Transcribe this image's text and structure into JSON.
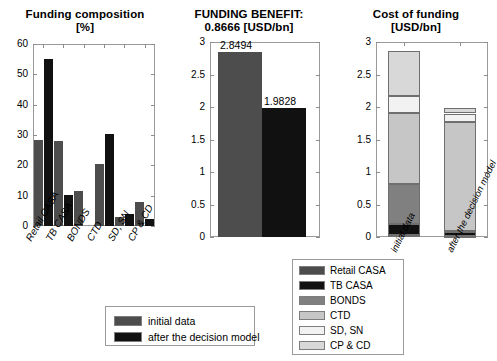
{
  "colors": {
    "retail_casa": "#4d4d4d",
    "tb_casa": "#111111",
    "bonds": "#808080",
    "ctd": "#c6c6c6",
    "sd_sn": "#f2f2f2",
    "cp_cd": "#d8d8d8",
    "initial": "#4d4d4d",
    "after": "#111111",
    "axis": "#9a9a9a"
  },
  "chart_data": [
    {
      "type": "bar",
      "title": "Funding composition",
      "subtitle": "[%]",
      "xlabel": "",
      "ylabel": "",
      "ylim": [
        0,
        60
      ],
      "yticks": [
        "0",
        "10",
        "20",
        "30",
        "40",
        "50",
        "60"
      ],
      "grid": false,
      "categories": [
        "Retail CASA",
        "TB CASA",
        "BONDS",
        "CTD",
        "SD, SN",
        "CP & CD"
      ],
      "series": [
        {
          "name": "initial data",
          "values": [
            28.3,
            27.9,
            11.4,
            20.5,
            3.1,
            7.8
          ]
        },
        {
          "name": "after the decision model",
          "values": [
            55.0,
            10.3,
            0.0,
            30.2,
            4.1,
            2.2
          ]
        }
      ],
      "legend_position": "below"
    },
    {
      "type": "bar",
      "title": "FUNDING BENEFIT:",
      "subtitle": "0.8666 [USD/bn]",
      "xlabel": "",
      "ylabel": "",
      "ylim": [
        0,
        3
      ],
      "yticks": [
        "0",
        "0.5",
        "1",
        "1.5",
        "2",
        "2.5",
        "3"
      ],
      "grid": false,
      "categories": [
        "initial data",
        "after the decision model"
      ],
      "values": [
        2.8494,
        1.9828
      ],
      "data_labels": [
        "2.8494",
        "1.9828"
      ]
    },
    {
      "type": "bar",
      "title": "Cost of funding",
      "subtitle": "[USD/bn]",
      "xlabel": "",
      "ylabel": "",
      "ylim": [
        0,
        3
      ],
      "yticks": [
        "0",
        "0.5",
        "1",
        "1.5",
        "2",
        "2.5",
        "3"
      ],
      "grid": false,
      "stacked": true,
      "categories": [
        "initial data",
        "after the decision model"
      ],
      "series": [
        {
          "name": "Retail CASA",
          "values": [
            0.03,
            0.02
          ]
        },
        {
          "name": "TB CASA",
          "values": [
            0.17,
            0.06
          ]
        },
        {
          "name": "BONDS",
          "values": [
            0.62,
            0.02
          ]
        },
        {
          "name": "CTD",
          "values": [
            1.09,
            1.67
          ]
        },
        {
          "name": "SD, SN",
          "values": [
            0.26,
            0.13
          ]
        },
        {
          "name": "CP & CD",
          "values": [
            0.69,
            0.08
          ]
        }
      ],
      "totals": [
        2.86,
        1.98
      ]
    }
  ],
  "legend_main": {
    "items": [
      {
        "label": "initial data",
        "color_key": "initial"
      },
      {
        "label": "after the decision model",
        "color_key": "after"
      }
    ]
  },
  "legend_stack": {
    "items": [
      {
        "label": "Retail CASA",
        "color_key": "retail_casa"
      },
      {
        "label": "TB CASA",
        "color_key": "tb_casa"
      },
      {
        "label": "BONDS",
        "color_key": "bonds"
      },
      {
        "label": "CTD",
        "color_key": "ctd"
      },
      {
        "label": "SD, SN",
        "color_key": "sd_sn"
      },
      {
        "label": "CP & CD",
        "color_key": "cp_cd"
      }
    ]
  }
}
